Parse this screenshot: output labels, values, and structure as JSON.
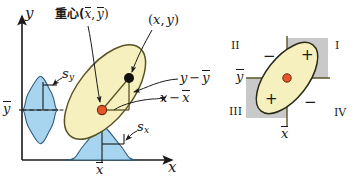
{
  "figure": {
    "colors": {
      "ellipse_fill": "#F6F0BE",
      "ellipse_stroke": "#5a5326",
      "marginal_fill": "#A7D4EE",
      "marginal_stroke": "#2f5d7a",
      "centroid_fill": "#E8552A",
      "centroid_stroke": "#6a2a12",
      "point_fill": "#111111",
      "axis": "#1a1a1a",
      "quadrant_shade": "#C9C9C9",
      "quadrant_axis": "#5a5326"
    },
    "left_panel": {
      "axis_y_label": "y",
      "axis_x_label": "x",
      "y_mean_tick_label": "y",
      "x_mean_tick_label": "x",
      "centroid_label": "重心(",
      "centroid_label_x": "x",
      "centroid_label_sep": ",",
      "centroid_label_y": "y",
      "centroid_label_close": ")",
      "point_label_open": "(",
      "point_label_x": "x",
      "point_label_sep": ",",
      "point_label_y": "y",
      "point_label_close": ")",
      "dev_y_label_lead": "y",
      "dev_y_label_minus": "−",
      "dev_y_label_mean": "y",
      "dev_x_label_lead": "x",
      "dev_x_label_minus": "−",
      "dev_x_label_mean": "x",
      "sd_y_label": "s",
      "sd_y_sub": "y",
      "sd_x_label": "s",
      "sd_x_sub": "x"
    },
    "right_panel": {
      "quadrant_1": "I",
      "quadrant_2": "II",
      "quadrant_3": "III",
      "quadrant_4": "IV",
      "sign_q1": "+",
      "sign_q2": "−",
      "sign_q3": "+",
      "sign_q4": "−",
      "y_mean_label": "y",
      "x_mean_label": "x"
    }
  }
}
